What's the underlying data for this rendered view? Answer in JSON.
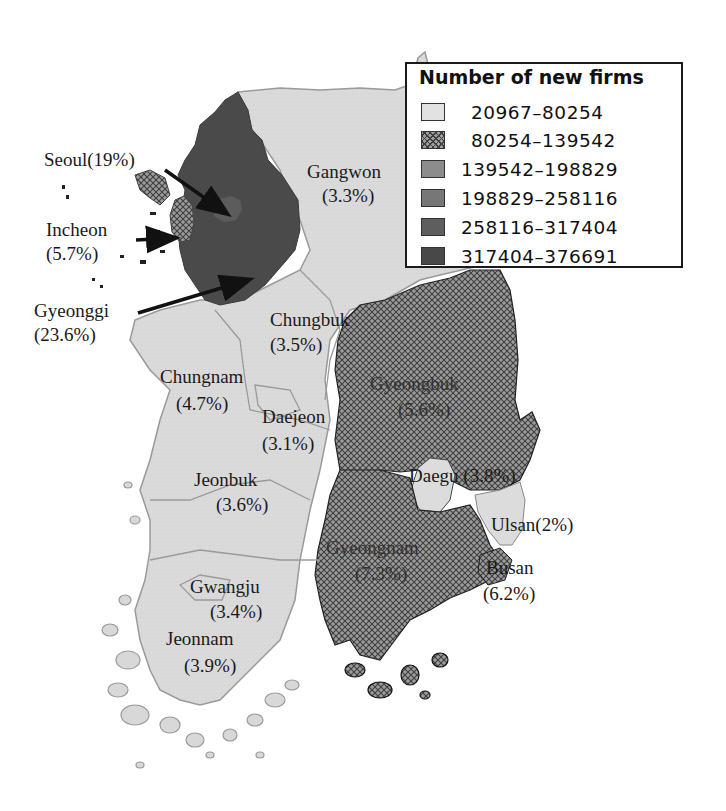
{
  "legend": {
    "title": "Number of new firms",
    "classes": [
      {
        "label": "20967–80254",
        "color": "#e0e0e0",
        "pattern": "solid"
      },
      {
        "label": "80254–139542",
        "color": "#9a9a9a",
        "pattern": "crosshatch"
      },
      {
        "label": "139542–198829",
        "color": "#8c8c8c",
        "pattern": "solid"
      },
      {
        "label": "198829–258116",
        "color": "#777777",
        "pattern": "solid"
      },
      {
        "label": "258116–317404",
        "color": "#5e5e5e",
        "pattern": "solid"
      },
      {
        "label": "317404–376691",
        "color": "#4a4a4a",
        "pattern": "solid"
      }
    ]
  },
  "regions": [
    {
      "name": "Seoul",
      "share": "19%",
      "label": "Seoul(19%)",
      "class": 6
    },
    {
      "name": "Incheon",
      "share": "5.7%",
      "label_line1": "Incheon",
      "label_line2": "(5.7%)",
      "class": 2
    },
    {
      "name": "Gyeonggi",
      "share": "23.6%",
      "label_line1": "Gyeonggi",
      "label_line2": "(23.6%)",
      "class": 6
    },
    {
      "name": "Gangwon",
      "share": "3.3%",
      "label_line1": "Gangwon",
      "label_line2": "(3.3%)",
      "class": 1
    },
    {
      "name": "Chungbuk",
      "share": "3.5%",
      "label_line1": "Chungbuk",
      "label_line2": "(3.5%)",
      "class": 1
    },
    {
      "name": "Chungnam",
      "share": "4.7%",
      "label_line1": "Chungnam",
      "label_line2": "(4.7%)",
      "class": 1
    },
    {
      "name": "Daejeon",
      "share": "3.1%",
      "label_line1": "Daejeon",
      "label_line2": "(3.1%)",
      "class": 1
    },
    {
      "name": "Gyeongbuk",
      "share": "5.6%",
      "label_line1": "Gyeongbuk",
      "label_line2": "(5.6%)",
      "class": 2
    },
    {
      "name": "Daegu",
      "share": "3.8%",
      "label": "Daegu (3.8%)",
      "class": 1
    },
    {
      "name": "Jeonbuk",
      "share": "3.6%",
      "label_line1": "Jeonbuk",
      "label_line2": "(3.6%)",
      "class": 1
    },
    {
      "name": "Ulsan",
      "share": "2%",
      "label": "Ulsan(2%)",
      "class": 1
    },
    {
      "name": "Gyeongnam",
      "share": "7.3%",
      "label_line1": "Gyeongnam",
      "label_line2": "(7.3%)",
      "class": 2
    },
    {
      "name": "Busan",
      "share": "6.2%",
      "label_line1": "Busan",
      "label_line2": "(6.2%)",
      "class": 2
    },
    {
      "name": "Gwangju",
      "share": "3.4%",
      "label_line1": "Gwangju",
      "label_line2": "(3.4%)",
      "class": 1
    },
    {
      "name": "Jeonnam",
      "share": "3.9%",
      "label_line1": "Jeonnam",
      "label_line2": "(3.9%)",
      "class": 1
    }
  ],
  "colors": {
    "light": "#dcdcdc",
    "hatch_bg": "#8e8e8e",
    "hatch_line": "#3a3a3a",
    "dark": "#4a4a4a",
    "seoul": "#5a5a5a",
    "border": "#9a9a9a",
    "arrow": "#111111"
  }
}
